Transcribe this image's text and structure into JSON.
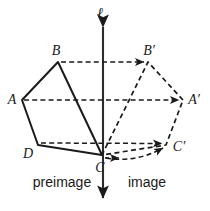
{
  "figure": {
    "type": "geometry-reflection-diagram",
    "background_color": "#ffffff",
    "stroke_color": "#1a1a1a",
    "line_of_reflection": {
      "name": "line-ell",
      "label": "ℓ",
      "label_x": 100,
      "label_y": 14,
      "x": 103,
      "y_top": 25,
      "y_bottom": 200,
      "arrow_top": true,
      "arrow_bottom": true
    },
    "side_labels": [
      {
        "name": "preimage-label",
        "text": "preimage",
        "x": 62,
        "y": 182
      },
      {
        "name": "image-label",
        "text": "image",
        "x": 146,
        "y": 182
      }
    ],
    "preimage": {
      "name": "preimage-polygon",
      "style": "solid",
      "points": "22,100 58,62 102,155 38,145",
      "vertices": [
        {
          "name": "vertex-A",
          "label": "A",
          "x": 22,
          "y": 100,
          "label_x": 12,
          "label_y": 102
        },
        {
          "name": "vertex-B",
          "label": "B",
          "x": 58,
          "y": 62,
          "label_x": 55,
          "label_y": 52
        },
        {
          "name": "vertex-C",
          "label": "C",
          "x": 102,
          "y": 155,
          "label_x": 99,
          "label_y": 173
        },
        {
          "name": "vertex-D",
          "label": "D",
          "x": 38,
          "y": 145,
          "label_x": 27,
          "label_y": 159
        }
      ]
    },
    "image": {
      "name": "image-polygon",
      "style": "dashed",
      "points": "183,100 148,62 102,155 166,145",
      "vertices": [
        {
          "name": "vertex-A-prime",
          "label": "A′",
          "x": 183,
          "y": 100,
          "label_x": 189,
          "label_y": 102
        },
        {
          "name": "vertex-B-prime",
          "label": "B′",
          "x": 148,
          "y": 62,
          "label_x": 145,
          "label_y": 52
        },
        {
          "name": "vertex-C-prime",
          "label": "C′",
          "x": 102,
          "y": 155,
          "label_x": 102,
          "label_y": 173
        },
        {
          "name": "vertex-D-prime",
          "label": "D′",
          "x": 166,
          "y": 145,
          "label_x": 172,
          "label_y": 150
        }
      ]
    },
    "correspondence_arrows": [
      {
        "name": "arrow-A-to-A-prime",
        "x1": 24,
        "y1": 100,
        "x2": 180,
        "y2": 100
      },
      {
        "name": "arrow-B-to-B-prime",
        "x1": 60,
        "y1": 62,
        "x2": 145,
        "y2": 62
      },
      {
        "name": "arrow-D-to-D-prime",
        "x1": 40,
        "y1": 143,
        "x2": 163,
        "y2": 143
      },
      {
        "name": "arrow-C-to-C-prime",
        "x1": 104,
        "y1": 158,
        "x2": 120,
        "y2": 158
      }
    ],
    "curved_arrow": {
      "name": "arrow-C-curve-to-D-prime",
      "path": "M 103 156 Q 135 162 165 147"
    }
  }
}
